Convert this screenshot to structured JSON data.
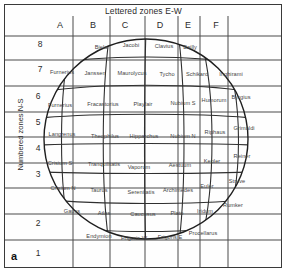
{
  "figure": {
    "panel_letter": "a",
    "top_title": "Lettered zones E-W",
    "left_title": "Numbered zones N-S",
    "columns": [
      "A",
      "B",
      "C",
      "D",
      "E",
      "F"
    ],
    "rows": [
      "8",
      "7",
      "6",
      "5",
      "4",
      "3",
      "2",
      "1"
    ],
    "colors": {
      "frame": "#3a3a3a",
      "grid": "#4a4a4a",
      "globe": "#2f2f2f",
      "text": "#2b2b2b",
      "label": "#444444",
      "background": "#ffffff"
    },
    "labels": [
      {
        "name": "biela",
        "text": "Biela",
        "x": 101,
        "y": 47
      },
      {
        "name": "jacobi",
        "text": "Jacobi",
        "x": 131,
        "y": 45
      },
      {
        "name": "clavius",
        "text": "Clavius",
        "x": 164,
        "y": 46
      },
      {
        "name": "bailly",
        "text": "Bailly",
        "x": 190,
        "y": 47
      },
      {
        "name": "furnerius-7",
        "text": "Furnerius",
        "x": 62,
        "y": 72
      },
      {
        "name": "janssen",
        "text": "Janssen",
        "x": 95,
        "y": 73
      },
      {
        "name": "maurolycus",
        "text": "Maurolycus",
        "x": 132,
        "y": 73
      },
      {
        "name": "tycho",
        "text": "Tycho",
        "x": 167,
        "y": 74
      },
      {
        "name": "schikard",
        "text": "Schikard",
        "x": 197,
        "y": 74
      },
      {
        "name": "inghirami",
        "text": "Inghirami",
        "x": 231,
        "y": 74
      },
      {
        "name": "furnerius-6",
        "text": "Furnerius",
        "x": 60,
        "y": 105
      },
      {
        "name": "fracastorius",
        "text": "Fracastorius",
        "x": 103,
        "y": 104
      },
      {
        "name": "playfair",
        "text": "Playfair",
        "x": 143,
        "y": 104
      },
      {
        "name": "nubium-s",
        "text": "Nubium S",
        "x": 183,
        "y": 103
      },
      {
        "name": "humorum",
        "text": "Humorum",
        "x": 214,
        "y": 100
      },
      {
        "name": "byrgius",
        "text": "Byrgius",
        "x": 241,
        "y": 97
      },
      {
        "name": "langrenus",
        "text": "Langrenus",
        "x": 62,
        "y": 134
      },
      {
        "name": "theophilus",
        "text": "Theophilus",
        "x": 105,
        "y": 136
      },
      {
        "name": "hipparchus",
        "text": "Hipparchus",
        "x": 144,
        "y": 136
      },
      {
        "name": "nubium-n",
        "text": "Nubium N",
        "x": 183,
        "y": 136
      },
      {
        "name": "riphaus",
        "text": "Riphaus",
        "x": 215,
        "y": 132
      },
      {
        "name": "grimaldi",
        "text": "Grimaldi",
        "x": 244,
        "y": 128
      },
      {
        "name": "crisium-s",
        "text": "Crisium S",
        "x": 60,
        "y": 163
      },
      {
        "name": "tranquilitatis",
        "text": "Tranquilitatis",
        "x": 104,
        "y": 164
      },
      {
        "name": "vaporum",
        "text": "Vaporum",
        "x": 139,
        "y": 167
      },
      {
        "name": "aestuum",
        "text": "Aestuum",
        "x": 180,
        "y": 165
      },
      {
        "name": "kepler",
        "text": "Kepler",
        "x": 212,
        "y": 161
      },
      {
        "name": "reiner",
        "text": "Reiner",
        "x": 242,
        "y": 156
      },
      {
        "name": "crisium-n",
        "text": "Crisium N",
        "x": 63,
        "y": 188
      },
      {
        "name": "taurus",
        "text": "Taurus",
        "x": 99,
        "y": 190
      },
      {
        "name": "serenitatis",
        "text": "Serenitatis",
        "x": 141,
        "y": 192
      },
      {
        "name": "archimedes",
        "text": "Archimedes",
        "x": 178,
        "y": 190
      },
      {
        "name": "euler",
        "text": "Euler",
        "x": 207,
        "y": 186
      },
      {
        "name": "struve",
        "text": "Struve",
        "x": 237,
        "y": 181
      },
      {
        "name": "gauss",
        "text": "Gauss",
        "x": 72,
        "y": 211
      },
      {
        "name": "atlas",
        "text": "Atlas",
        "x": 104,
        "y": 213
      },
      {
        "name": "caucasus",
        "text": "Caucasus",
        "x": 143,
        "y": 214
      },
      {
        "name": "plato",
        "text": "Plato",
        "x": 177,
        "y": 213
      },
      {
        "name": "iridum",
        "text": "Iridum",
        "x": 205,
        "y": 211
      },
      {
        "name": "rumker",
        "text": "Rumker",
        "x": 233,
        "y": 205
      },
      {
        "name": "endymion",
        "text": "Endymion",
        "x": 99,
        "y": 236
      },
      {
        "name": "frigoris-w",
        "text": "Frigoris W",
        "x": 134,
        "y": 238
      },
      {
        "name": "frigoris-e",
        "text": "Frigoris E",
        "x": 170,
        "y": 237
      },
      {
        "name": "procellarus",
        "text": "Procellarus",
        "x": 203,
        "y": 233
      }
    ],
    "grid": {
      "v_lines": [
        73,
        110,
        145,
        178,
        200,
        228
      ],
      "h_lines": [
        36,
        60,
        86,
        112,
        137,
        163,
        188,
        214,
        240
      ],
      "col_letter_x": [
        60,
        93,
        125,
        160,
        188,
        216
      ],
      "row_number_y": [
        44,
        70,
        96,
        122,
        148,
        174,
        222,
        252
      ],
      "row_number_x": [
        40,
        40,
        38,
        38,
        38,
        38,
        38,
        38
      ]
    }
  }
}
